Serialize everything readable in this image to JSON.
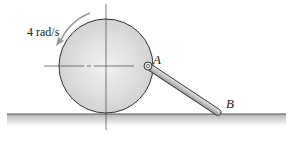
{
  "diagram": {
    "angular_velocity_label": "4 rad/s",
    "point_a_label": "A",
    "point_b_label": "B",
    "elements": [
      "disk",
      "rod-AB",
      "ground",
      "pin-A",
      "rotation-arrow",
      "center-lines"
    ],
    "colors": {
      "disk_fill": "#d9d9d9",
      "rod_fill": "#c8c8c8",
      "ground_shade": "#bdbdbd",
      "line": "#333333"
    }
  }
}
